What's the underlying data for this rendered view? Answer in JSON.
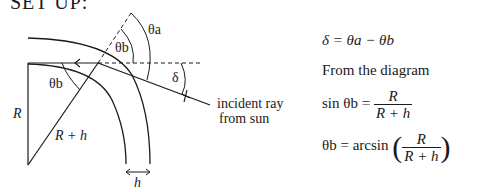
{
  "header": "SET UP:",
  "diagram": {
    "labels": {
      "theta_a": "θa",
      "theta_b_top": "θb",
      "theta_b_center": "θb",
      "delta": "δ",
      "R": "R",
      "R_plus_h": "R + h",
      "h": "h",
      "incident_ray_line1": "incident ray",
      "incident_ray_line2": "from sun"
    }
  },
  "equations": {
    "eq1": "δ = θa − θb",
    "text": "From the diagram",
    "eq2_lhs": "sin θb =",
    "eq2_num": "R",
    "eq2_den": "R + h",
    "eq3_lhs": "θb = arcsin",
    "eq3_num": "R",
    "eq3_den": "R + h"
  }
}
